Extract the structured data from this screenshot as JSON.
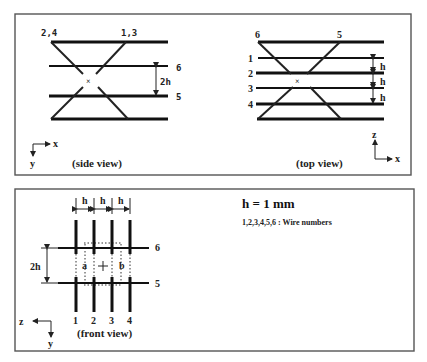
{
  "side_view": {
    "caption": "(side view)",
    "top_left_label": "2,4",
    "top_right_label": "1,3",
    "wire_6_label": "6",
    "wire_5_label": "5",
    "gap_label": "2h",
    "axis_x": "x",
    "axis_y": "y"
  },
  "top_view": {
    "caption": "(top view)",
    "top_left_label": "6",
    "top_right_label": "5",
    "wire_labels": [
      "1",
      "2",
      "3",
      "4"
    ],
    "gap_labels": [
      "h",
      "h",
      "h"
    ],
    "axis_z": "z",
    "axis_x": "x"
  },
  "front_view": {
    "caption": "(front view)",
    "top_gap_labels": [
      "h",
      "h",
      "h"
    ],
    "wire_labels": [
      "1",
      "2",
      "3",
      "4"
    ],
    "wire_6_label": "6",
    "wire_5_label": "5",
    "gap_label": "2h",
    "region_a": "a",
    "region_b": "b",
    "axis_z": "z",
    "axis_y": "y"
  },
  "legend": {
    "spacing": "h = 1 mm",
    "wire_note": "1,2,3,4,5,6 : Wire numbers"
  }
}
